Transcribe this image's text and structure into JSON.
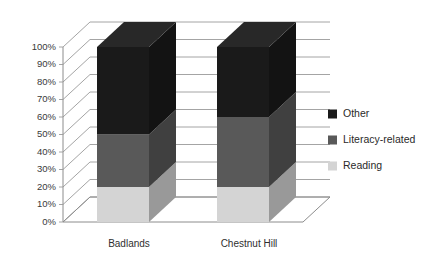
{
  "chart_data": {
    "type": "bar",
    "subtype": "stacked-column-3d-percent",
    "title": "",
    "xlabel": "",
    "ylabel": "",
    "categories": [
      "Badlands",
      "Chestnut Hill"
    ],
    "series": [
      {
        "name": "Reading",
        "values": [
          20,
          20
        ],
        "color": "#d4d4d4"
      },
      {
        "name": "Literacy-related",
        "values": [
          30,
          40
        ],
        "color": "#595959"
      },
      {
        "name": "Other",
        "values": [
          50,
          40
        ],
        "color": "#1a1a1a"
      }
    ],
    "stack_order_bottom_to_top": [
      "Reading",
      "Literacy-related",
      "Other"
    ],
    "ylim": [
      0,
      100
    ],
    "ytick_values": [
      0,
      10,
      20,
      30,
      40,
      50,
      60,
      70,
      80,
      90,
      100
    ],
    "ytick_labels": [
      "0%",
      "10%",
      "20%",
      "30%",
      "40%",
      "50%",
      "60%",
      "70%",
      "80%",
      "90%",
      "100%"
    ],
    "grid": true,
    "legend_position": "right",
    "legend_entries": [
      {
        "label": "Other",
        "color": "#1a1a1a"
      },
      {
        "label": "Literacy-related",
        "color": "#595959"
      },
      {
        "label": "Reading",
        "color": "#d4d4d4"
      }
    ],
    "background_color": "#ffffff",
    "gridline_color": "#9a9a9a",
    "axis_color": "#8c8c8c"
  }
}
